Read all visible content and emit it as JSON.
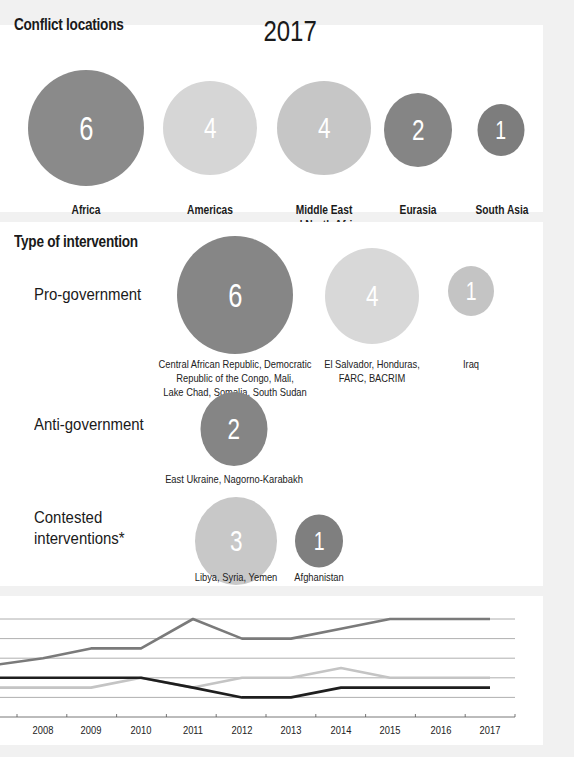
{
  "conflict_locations": {
    "title": "Conflict locations",
    "year": "2017",
    "regions": [
      {
        "label": "Africa",
        "value": "6",
        "color": "#8a8a8a"
      },
      {
        "label": "Americas",
        "value": "4",
        "color": "#d6d6d6"
      },
      {
        "label_line1": "Middle East",
        "label_line2": "and North Africa",
        "value": "4",
        "color": "#c6c6c6"
      },
      {
        "label": "Eurasia",
        "value": "2",
        "color": "#858585"
      },
      {
        "label": "South Asia",
        "value": "1",
        "color": "#7d7d7d"
      }
    ]
  },
  "intervention": {
    "title": "Type of intervention",
    "rows": [
      {
        "label": "Pro-government",
        "groups": [
          {
            "value": "6",
            "color": "#868686",
            "lines": [
              "Central African Republic, Democratic",
              "Republic of the Congo, Mali,",
              "Lake Chad, Somalia, South Sudan"
            ]
          },
          {
            "value": "4",
            "color": "#d8d8d8",
            "lines": [
              "El Salvador, Honduras,",
              "FARC, BACRIM"
            ]
          },
          {
            "value": "1",
            "color": "#c4c4c4",
            "lines": [
              "Iraq"
            ]
          }
        ]
      },
      {
        "label": "Anti-government",
        "groups": [
          {
            "value": "2",
            "color": "#858585",
            "lines": [
              "East Ukraine, Nagorno-Karabakh"
            ]
          }
        ]
      },
      {
        "label_line1": "Contested",
        "label_line2": "interventions*",
        "groups": [
          {
            "value": "3",
            "color": "#c8c8c8",
            "lines": [
              "Libya, Syria, Yemen"
            ]
          },
          {
            "value": "1",
            "color": "#7f7f7f",
            "lines": [
              "Afghanistan"
            ]
          }
        ]
      }
    ]
  },
  "chart_data": [
    {
      "type": "bubble",
      "title": "Conflict locations 2017",
      "categories": [
        "Africa",
        "Americas",
        "Middle East and North Africa",
        "Eurasia",
        "South Asia"
      ],
      "values": [
        6,
        4,
        4,
        2,
        1
      ]
    },
    {
      "type": "bubble",
      "title": "Type of intervention",
      "series": [
        {
          "name": "Pro-government",
          "values": [
            6,
            4,
            1
          ],
          "labels": [
            "Central African Republic, Democratic Republic of the Congo, Mali, Lake Chad, Somalia, South Sudan",
            "El Salvador, Honduras, FARC, BACRIM",
            "Iraq"
          ]
        },
        {
          "name": "Anti-government",
          "values": [
            2
          ],
          "labels": [
            "East Ukraine, Nagorno-Karabakh"
          ]
        },
        {
          "name": "Contested interventions*",
          "values": [
            3,
            1
          ],
          "labels": [
            "Libya, Syria, Yemen",
            "Afghanistan"
          ]
        }
      ]
    },
    {
      "type": "line",
      "title": "",
      "xlabel": "",
      "ylabel": "",
      "grid": true,
      "x": [
        "2007",
        "2008",
        "2009",
        "2010",
        "2011",
        "2012",
        "2013",
        "2014",
        "2015",
        "2016",
        "2017"
      ],
      "x_tick_labels": [
        "2008",
        "2009",
        "2010",
        "2011",
        "2012",
        "2013",
        "2014",
        "2015",
        "2016",
        "2017"
      ],
      "ylim": [
        0,
        10
      ],
      "gridlines": [
        2,
        4,
        6,
        8,
        10
      ],
      "series": [
        {
          "name": "medium-gray series",
          "color": "#7a7a7a",
          "values": [
            5.3,
            6,
            7,
            7,
            10,
            8,
            8,
            9,
            10,
            10,
            10
          ]
        },
        {
          "name": "light-gray series",
          "color": "#c4c4c4",
          "values": [
            3,
            3,
            3,
            4,
            3,
            4,
            4,
            5,
            4,
            4,
            4
          ]
        },
        {
          "name": "black series",
          "color": "#1e1e1e",
          "values": [
            4,
            4,
            4,
            4,
            3,
            2,
            2,
            3,
            3,
            3,
            3
          ]
        }
      ]
    }
  ]
}
